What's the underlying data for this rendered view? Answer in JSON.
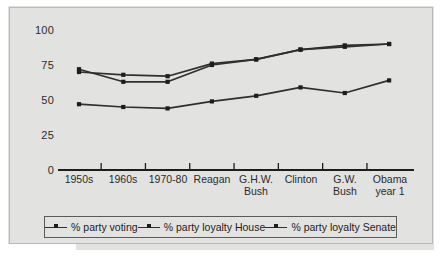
{
  "chart_data": {
    "type": "line",
    "title": "",
    "xlabel": "",
    "ylabel": "",
    "ylim": [
      0,
      100
    ],
    "yticks": [
      0,
      25,
      50,
      75,
      100
    ],
    "grid": false,
    "legend_position": "bottom",
    "categories": [
      "1950s",
      "1960s",
      "1970-80",
      "Reagan",
      "G.H.W.\nBush",
      "Clinton",
      "G.W.\nBush",
      "Obama\nyear 1"
    ],
    "series": [
      {
        "name": "% party voting",
        "values": [
          47,
          45,
          44,
          49,
          53,
          59,
          55,
          64
        ],
        "color": "#2f2f2f"
      },
      {
        "name": "% party loyalty House",
        "values": [
          70,
          68,
          67,
          76,
          79,
          86,
          88,
          90
        ],
        "color": "#2f2f2f"
      },
      {
        "name": "% party loyalty Senate",
        "values": [
          72,
          63,
          63,
          75,
          79,
          86,
          89,
          90
        ],
        "color": "#2f2f2f"
      }
    ]
  },
  "axis": {
    "y_labels": [
      "100",
      "75",
      "50",
      "25",
      "0"
    ],
    "x_labels": [
      "1950s",
      "1960s",
      "1970-80",
      "G.H.W.\nBush",
      "Reagan",
      "Clinton",
      "G.W.\nBush",
      "Obama\nyear 1"
    ]
  },
  "legend": {
    "items": [
      {
        "label": "% party voting"
      },
      {
        "label": "% party loyalty House"
      },
      {
        "label": "% party loyalty Senate"
      }
    ]
  },
  "colors": {
    "background": "#ffffff",
    "plate": "#e2e2e0",
    "ink": "#2f2f2f",
    "frame": "#b9b9b6"
  }
}
